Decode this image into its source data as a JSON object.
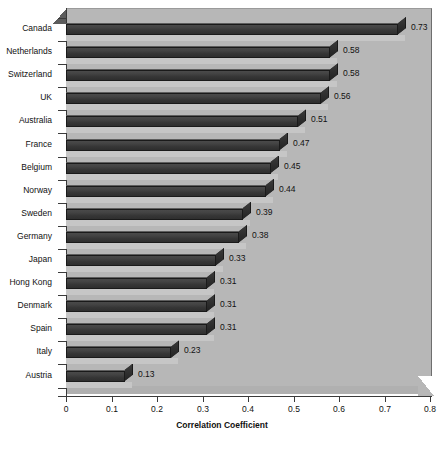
{
  "chart_data": {
    "type": "bar",
    "orientation": "horizontal",
    "style": "3d",
    "title": "",
    "xlabel": "Correlation Coefficient",
    "ylabel": "",
    "xlim": [
      0,
      0.8
    ],
    "xticks": [
      "0",
      "0.1",
      "0.2",
      "0.3",
      "0.4",
      "0.5",
      "0.6",
      "0.7",
      "0.8"
    ],
    "xtick_values": [
      0,
      0.1,
      0.2,
      0.3,
      0.4,
      0.5,
      0.6,
      0.7,
      0.8
    ],
    "grid": false,
    "legend": null,
    "categories": [
      "Canada",
      "Netherlands",
      "Switzerland",
      "UK",
      "Australia",
      "France",
      "Belgium",
      "Norway",
      "Sweden",
      "Germany",
      "Japan",
      "Hong Kong",
      "Denmark",
      "Spain",
      "Italy",
      "Austria"
    ],
    "values": [
      0.73,
      0.58,
      0.58,
      0.56,
      0.51,
      0.47,
      0.45,
      0.44,
      0.39,
      0.38,
      0.33,
      0.31,
      0.31,
      0.31,
      0.23,
      0.13
    ],
    "data_labels": [
      "0.73",
      "0.58",
      "0.58",
      "0.56",
      "0.51",
      "0.47",
      "0.45",
      "0.44",
      "0.39",
      "0.38",
      "0.33",
      "0.31",
      "0.31",
      "0.31",
      "0.23",
      "0.13"
    ],
    "colors": {
      "bar_face": "#3c3c3c",
      "bar_edge": "#1a1a1a",
      "plot_background": "#b7b7b7",
      "axis": "#3a3a3a",
      "text": "#111111",
      "figure_background": "#ffffff"
    }
  },
  "footer": {
    "caption": ""
  }
}
